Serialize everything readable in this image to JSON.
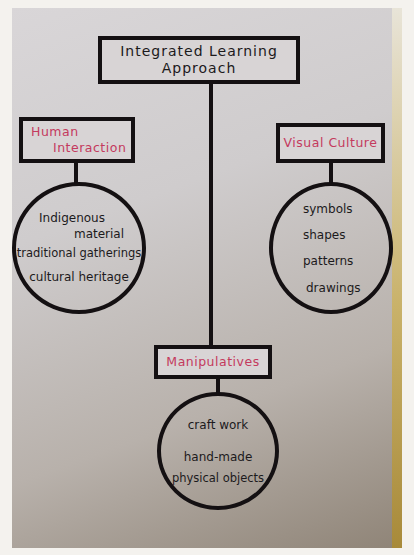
{
  "diagram": {
    "title": {
      "line1": "Integrated Learning",
      "line2": "Approach"
    },
    "nodes": {
      "human_interaction": {
        "label_line1": "Human",
        "label_line2": "Interaction",
        "items": [
          "Indigenous",
          "material",
          "traditional gatherings",
          "cultural heritage"
        ]
      },
      "visual_culture": {
        "label": "Visual Culture",
        "items": [
          "symbols",
          "shapes",
          "patterns",
          "drawings"
        ]
      },
      "manipulatives": {
        "label": "Manipulatives",
        "items": [
          "craft work",
          "hand-made",
          "physical objects"
        ]
      }
    },
    "colors": {
      "ink": "#141012",
      "category_text": "#c43a5e",
      "paper": "#d8d4d5"
    }
  }
}
